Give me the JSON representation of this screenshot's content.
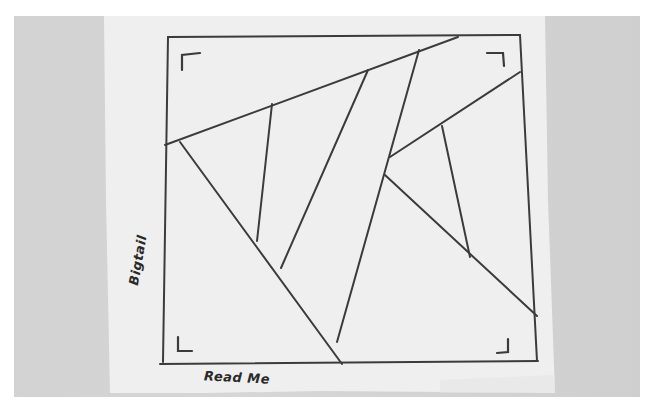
{
  "photo": {
    "description": "Photo of a paper napkin with a hand-drawn quilt block sketch",
    "background_color": "#d3d3d3",
    "paper_color": "#f1f1f1",
    "ink_color": "#3a3a3a"
  },
  "sketch": {
    "side_label": "Bigtail",
    "bottom_label": "Read Me",
    "corner_marks": [
      "top-left",
      "top-right",
      "bottom-left",
      "bottom-right"
    ]
  }
}
